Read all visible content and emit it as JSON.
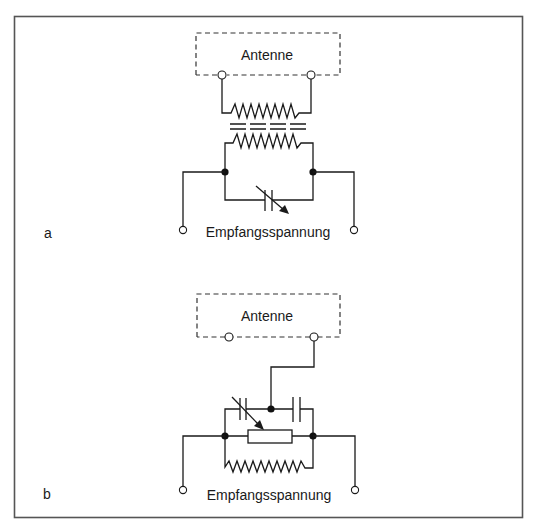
{
  "figure": {
    "colors": {
      "ink": "#1a1a1a",
      "frame": "#555555",
      "background": "#ffffff"
    },
    "panels": [
      {
        "id": "a",
        "panel_label": "a",
        "antenna_label": "Antenne",
        "output_label": "Empfangsspannung",
        "components": [
          "transformer-primary-coil",
          "transformer-iron-core",
          "transformer-secondary-coil",
          "variable-capacitor"
        ]
      },
      {
        "id": "b",
        "panel_label": "b",
        "antenna_label": "Antenne",
        "output_label": "Empfangsspannung",
        "components": [
          "variable-capacitor",
          "fixed-capacitor",
          "potentiometer",
          "coil"
        ]
      }
    ]
  }
}
